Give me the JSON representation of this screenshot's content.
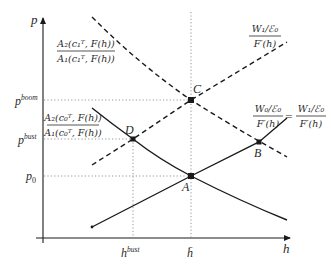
{
  "diagram": {
    "axes": {
      "y_label": "p",
      "x_label": "h"
    },
    "y_ticks": [
      {
        "id": "p_boom",
        "base": "p",
        "sup": "boom"
      },
      {
        "id": "p_bust",
        "base": "p",
        "sup": "bust"
      },
      {
        "id": "p_0",
        "base": "p",
        "sub": "0"
      }
    ],
    "x_ticks": [
      {
        "id": "h_bust",
        "base": "h",
        "sup": "bust"
      },
      {
        "id": "h_bar",
        "base": "h̄"
      }
    ],
    "points": [
      {
        "label": "A"
      },
      {
        "label": "B"
      },
      {
        "label": "C"
      },
      {
        "label": "D"
      }
    ],
    "curve_labels": {
      "upper_ratio": {
        "num": "A₂(c₁ᵀ, F(h))",
        "den": "A₁(c₁ᵀ, F(h))"
      },
      "lower_ratio": {
        "num": "A₂(c₀ᵀ, F(h))",
        "den": "A₁(c₀ᵀ, F(h))"
      },
      "w1_curve": {
        "num": "W₁/ℰ₀",
        "den": "F′(h)"
      },
      "w0_equals_w1": {
        "lhs_num": "W₀/ℰ₀",
        "lhs_den": "F′(h)",
        "eq": "=",
        "rhs_num": "W₁/ℰ₀",
        "rhs_den": "F′(h)"
      }
    },
    "colors": {
      "line": "#1a1a1a",
      "dotted": "#888888",
      "text": "#2a2a2a"
    }
  }
}
